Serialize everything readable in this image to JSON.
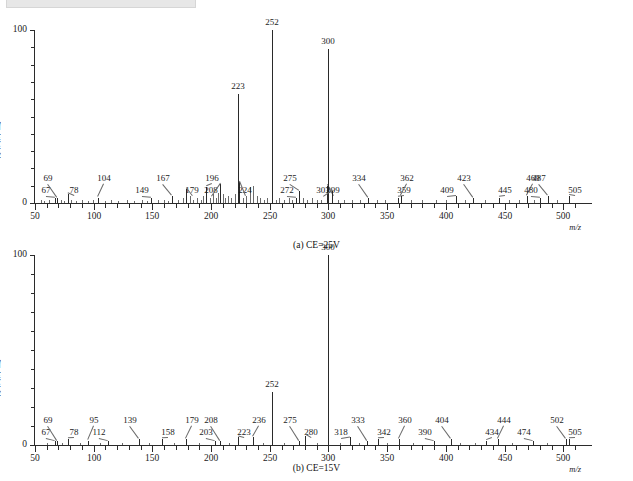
{
  "figure": {
    "ylabel": "相对丰度/%",
    "xunit": "m/z",
    "yticks": [
      "0",
      "100"
    ],
    "xticks": [
      "50",
      "100",
      "150",
      "200",
      "250",
      "300",
      "350",
      "400",
      "450",
      "500"
    ],
    "caption_a": "(a) CE=25V",
    "caption_b": "(b) CE=15V"
  },
  "chart_data": [
    {
      "type": "bar",
      "title": "(a) CE=25V",
      "xlabel": "m/z",
      "ylabel": "相对丰度/%",
      "xlim": [
        50,
        510
      ],
      "ylim": [
        0,
        100
      ],
      "grid": false,
      "legend": "none",
      "labeled_peaks": [
        {
          "mz": 67,
          "intensity": 3
        },
        {
          "mz": 69,
          "intensity": 3
        },
        {
          "mz": 78,
          "intensity": 5
        },
        {
          "mz": 104,
          "intensity": 3
        },
        {
          "mz": 149,
          "intensity": 3
        },
        {
          "mz": 167,
          "intensity": 4
        },
        {
          "mz": 179,
          "intensity": 8
        },
        {
          "mz": 196,
          "intensity": 9
        },
        {
          "mz": 208,
          "intensity": 11
        },
        {
          "mz": 223,
          "intensity": 63
        },
        {
          "mz": 224,
          "intensity": 12
        },
        {
          "mz": 252,
          "intensity": 100
        },
        {
          "mz": 272,
          "intensity": 3
        },
        {
          "mz": 275,
          "intensity": 7
        },
        {
          "mz": 299,
          "intensity": 10
        },
        {
          "mz": 300,
          "intensity": 89
        },
        {
          "mz": 303,
          "intensity": 7
        },
        {
          "mz": 334,
          "intensity": 3
        },
        {
          "mz": 359,
          "intensity": 3
        },
        {
          "mz": 362,
          "intensity": 4
        },
        {
          "mz": 409,
          "intensity": 4
        },
        {
          "mz": 423,
          "intensity": 3
        },
        {
          "mz": 445,
          "intensity": 3
        },
        {
          "mz": 469,
          "intensity": 4
        },
        {
          "mz": 480,
          "intensity": 3
        },
        {
          "mz": 487,
          "intensity": 4
        },
        {
          "mz": 505,
          "intensity": 4
        }
      ],
      "unlabeled_peaks": [
        {
          "mz": 55,
          "intensity": 2
        },
        {
          "mz": 58,
          "intensity": 1
        },
        {
          "mz": 62,
          "intensity": 2
        },
        {
          "mz": 72,
          "intensity": 2
        },
        {
          "mz": 75,
          "intensity": 1
        },
        {
          "mz": 81,
          "intensity": 2
        },
        {
          "mz": 85,
          "intensity": 1
        },
        {
          "mz": 90,
          "intensity": 2
        },
        {
          "mz": 95,
          "intensity": 1
        },
        {
          "mz": 99,
          "intensity": 2
        },
        {
          "mz": 110,
          "intensity": 1
        },
        {
          "mz": 115,
          "intensity": 2
        },
        {
          "mz": 121,
          "intensity": 1
        },
        {
          "mz": 128,
          "intensity": 2
        },
        {
          "mz": 134,
          "intensity": 1
        },
        {
          "mz": 141,
          "intensity": 2
        },
        {
          "mz": 145,
          "intensity": 1
        },
        {
          "mz": 155,
          "intensity": 2
        },
        {
          "mz": 160,
          "intensity": 2
        },
        {
          "mz": 163,
          "intensity": 1
        },
        {
          "mz": 172,
          "intensity": 2
        },
        {
          "mz": 176,
          "intensity": 3
        },
        {
          "mz": 182,
          "intensity": 4
        },
        {
          "mz": 185,
          "intensity": 2
        },
        {
          "mz": 188,
          "intensity": 3
        },
        {
          "mz": 191,
          "intensity": 2
        },
        {
          "mz": 193,
          "intensity": 4
        },
        {
          "mz": 199,
          "intensity": 3
        },
        {
          "mz": 202,
          "intensity": 5
        },
        {
          "mz": 204,
          "intensity": 3
        },
        {
          "mz": 206,
          "intensity": 6
        },
        {
          "mz": 210,
          "intensity": 5
        },
        {
          "mz": 212,
          "intensity": 3
        },
        {
          "mz": 214,
          "intensity": 4
        },
        {
          "mz": 217,
          "intensity": 3
        },
        {
          "mz": 220,
          "intensity": 5
        },
        {
          "mz": 227,
          "intensity": 3
        },
        {
          "mz": 230,
          "intensity": 4
        },
        {
          "mz": 233,
          "intensity": 9
        },
        {
          "mz": 236,
          "intensity": 10
        },
        {
          "mz": 239,
          "intensity": 4
        },
        {
          "mz": 242,
          "intensity": 3
        },
        {
          "mz": 245,
          "intensity": 2
        },
        {
          "mz": 248,
          "intensity": 3
        },
        {
          "mz": 255,
          "intensity": 2
        },
        {
          "mz": 258,
          "intensity": 3
        },
        {
          "mz": 262,
          "intensity": 2
        },
        {
          "mz": 266,
          "intensity": 3
        },
        {
          "mz": 269,
          "intensity": 2
        },
        {
          "mz": 278,
          "intensity": 3
        },
        {
          "mz": 282,
          "intensity": 2
        },
        {
          "mz": 286,
          "intensity": 3
        },
        {
          "mz": 290,
          "intensity": 2
        },
        {
          "mz": 294,
          "intensity": 2
        },
        {
          "mz": 308,
          "intensity": 2
        },
        {
          "mz": 313,
          "intensity": 2
        },
        {
          "mz": 320,
          "intensity": 2
        },
        {
          "mz": 327,
          "intensity": 2
        },
        {
          "mz": 341,
          "intensity": 2
        },
        {
          "mz": 348,
          "intensity": 2
        },
        {
          "mz": 370,
          "intensity": 2
        },
        {
          "mz": 380,
          "intensity": 2
        },
        {
          "mz": 392,
          "intensity": 2
        },
        {
          "mz": 400,
          "intensity": 2
        },
        {
          "mz": 416,
          "intensity": 2
        },
        {
          "mz": 433,
          "intensity": 2
        },
        {
          "mz": 454,
          "intensity": 2
        },
        {
          "mz": 462,
          "intensity": 2
        },
        {
          "mz": 475,
          "intensity": 2
        },
        {
          "mz": 495,
          "intensity": 2
        }
      ]
    },
    {
      "type": "bar",
      "title": "(b) CE=15V",
      "xlabel": "m/z",
      "ylabel": "相对丰度/%",
      "xlim": [
        50,
        510
      ],
      "ylim": [
        0,
        100
      ],
      "grid": false,
      "legend": "none",
      "labeled_peaks": [
        {
          "mz": 67,
          "intensity": 2
        },
        {
          "mz": 69,
          "intensity": 2
        },
        {
          "mz": 78,
          "intensity": 3
        },
        {
          "mz": 95,
          "intensity": 2
        },
        {
          "mz": 112,
          "intensity": 2
        },
        {
          "mz": 139,
          "intensity": 3
        },
        {
          "mz": 158,
          "intensity": 3
        },
        {
          "mz": 179,
          "intensity": 3
        },
        {
          "mz": 203,
          "intensity": 2
        },
        {
          "mz": 208,
          "intensity": 2
        },
        {
          "mz": 223,
          "intensity": 4
        },
        {
          "mz": 236,
          "intensity": 4
        },
        {
          "mz": 252,
          "intensity": 28
        },
        {
          "mz": 275,
          "intensity": 2
        },
        {
          "mz": 280,
          "intensity": 5
        },
        {
          "mz": 300,
          "intensity": 100
        },
        {
          "mz": 318,
          "intensity": 4
        },
        {
          "mz": 333,
          "intensity": 2
        },
        {
          "mz": 342,
          "intensity": 3
        },
        {
          "mz": 360,
          "intensity": 3
        },
        {
          "mz": 390,
          "intensity": 2
        },
        {
          "mz": 404,
          "intensity": 3
        },
        {
          "mz": 434,
          "intensity": 2
        },
        {
          "mz": 444,
          "intensity": 3
        },
        {
          "mz": 474,
          "intensity": 2
        },
        {
          "mz": 502,
          "intensity": 3
        },
        {
          "mz": 505,
          "intensity": 3
        }
      ],
      "unlabeled_peaks": [
        {
          "mz": 60,
          "intensity": 1
        },
        {
          "mz": 73,
          "intensity": 1
        },
        {
          "mz": 88,
          "intensity": 1
        },
        {
          "mz": 105,
          "intensity": 1
        },
        {
          "mz": 124,
          "intensity": 1
        },
        {
          "mz": 147,
          "intensity": 1
        },
        {
          "mz": 168,
          "intensity": 1
        },
        {
          "mz": 190,
          "intensity": 1
        },
        {
          "mz": 215,
          "intensity": 1
        },
        {
          "mz": 244,
          "intensity": 1
        },
        {
          "mz": 262,
          "intensity": 1
        },
        {
          "mz": 290,
          "intensity": 1
        },
        {
          "mz": 310,
          "intensity": 1
        },
        {
          "mz": 326,
          "intensity": 1
        },
        {
          "mz": 350,
          "intensity": 1
        },
        {
          "mz": 372,
          "intensity": 1
        },
        {
          "mz": 412,
          "intensity": 1
        },
        {
          "mz": 425,
          "intensity": 1
        },
        {
          "mz": 456,
          "intensity": 1
        },
        {
          "mz": 486,
          "intensity": 1
        }
      ]
    }
  ]
}
